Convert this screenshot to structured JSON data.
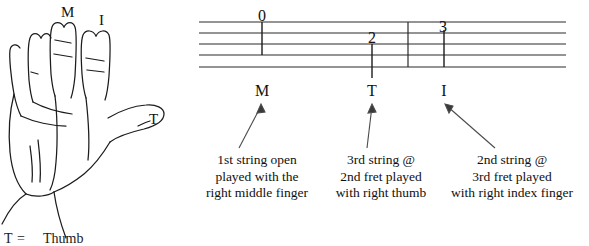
{
  "figure": {
    "title_alt": "Right hand finger assignment and tablature example"
  },
  "hand": {
    "labels": [
      {
        "id": "middle",
        "text": "M"
      },
      {
        "id": "index",
        "text": "I"
      },
      {
        "id": "thumb",
        "text": "T"
      }
    ],
    "legend": {
      "symbol": "T",
      "equals": "=",
      "word": "Thumb"
    }
  },
  "tablature": {
    "staff": {
      "line_count": 5,
      "barline_count": 1
    },
    "notes": [
      {
        "fret": "0",
        "finger": "M"
      },
      {
        "fret": "2",
        "finger": "T"
      },
      {
        "fret": "3",
        "finger": "I"
      }
    ],
    "fret_numbers": {
      "first": "0",
      "second": "2",
      "third": "3"
    },
    "finger_marks": {
      "first": "M",
      "second": "T",
      "third": "I"
    },
    "captions": [
      {
        "id": "caption-open-middle",
        "line1": "1st string open",
        "line2": "played with the",
        "line3": "right middle finger"
      },
      {
        "id": "caption-3rd-string-thumb",
        "line1": "3rd string @",
        "line2": "2nd fret played",
        "line3": "with right thumb"
      },
      {
        "id": "caption-2nd-string-index",
        "line1": "2nd string @",
        "line2": "3rd fret played",
        "line3": "with right index finger"
      }
    ]
  },
  "colors": {
    "ink": "#111111",
    "line": "#2b2b2b",
    "background": "#ffffff"
  }
}
